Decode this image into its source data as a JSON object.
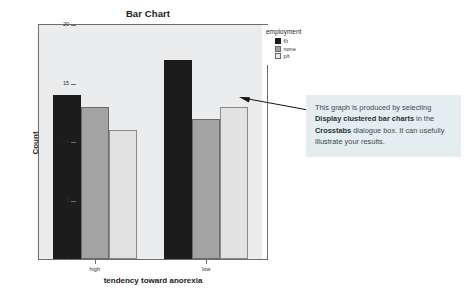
{
  "chart_data": {
    "type": "bar",
    "title": "Bar Chart",
    "xlabel": "tendency toward anorexia",
    "ylabel": "Count",
    "categories": [
      "high",
      "low"
    ],
    "series": [
      {
        "name": "f/t",
        "values": [
          14,
          17
        ],
        "color": "#1c1c1c"
      },
      {
        "name": "none",
        "values": [
          13,
          12
        ],
        "color": "#a3a3a3"
      },
      {
        "name": "p/t",
        "values": [
          11,
          13
        ],
        "color": "#e2e2e2"
      }
    ],
    "legend_title": "employment",
    "legend_position": "right",
    "ylim": [
      0,
      20
    ],
    "yticks": [
      0,
      5,
      10,
      15,
      20
    ],
    "ytick_labels": [
      "0",
      "5",
      "10",
      "15",
      "20"
    ],
    "grid": false,
    "plot_background": "#eaeced"
  },
  "annotation": {
    "line1_prefix": "This graph is produced by selecting ",
    "bold1": "Display clustered bar charts",
    "mid1": " in the ",
    "bold2": "Crosstabs",
    "tail": " dialogue box. It can usefully illustrate your results.",
    "full_text": "This graph is produced by selecting Display clustered bar charts in the Crosstabs dialogue box. It can usefully illustrate your results."
  },
  "icons": {
    "arrow": "arrow-left-icon"
  }
}
